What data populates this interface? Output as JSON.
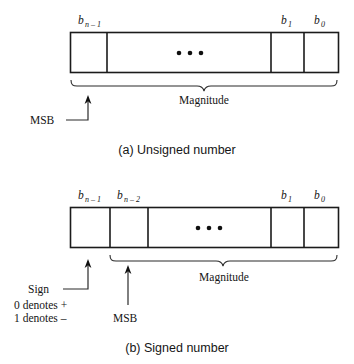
{
  "figure": {
    "background_color": "#ffffff",
    "line_color": "#1b1b1b",
    "panels": [
      {
        "id": "unsigned",
        "caption": "(a) Unsigned number",
        "cells": [
          {
            "label_base": "b",
            "label_sub": "n – 1",
            "show_label": true,
            "has_dots": false
          },
          {
            "label_base": "",
            "label_sub": "",
            "show_label": false,
            "has_dots": true
          },
          {
            "label_base": "b",
            "label_sub": "1",
            "show_label": true,
            "has_dots": false
          },
          {
            "label_base": "b",
            "label_sub": "0",
            "show_label": true,
            "has_dots": false
          }
        ],
        "brace_label": "Magnitude",
        "pointer_label": "MSB"
      },
      {
        "id": "signed",
        "caption": "(b) Signed number",
        "cells": [
          {
            "label_base": "b",
            "label_sub": "n – 1",
            "show_label": true,
            "has_dots": false
          },
          {
            "label_base": "b",
            "label_sub": "n – 2",
            "show_label": true,
            "has_dots": false
          },
          {
            "label_base": "",
            "label_sub": "",
            "show_label": false,
            "has_dots": true
          },
          {
            "label_base": "b",
            "label_sub": "1",
            "show_label": true,
            "has_dots": false
          },
          {
            "label_base": "b",
            "label_sub": "0",
            "show_label": true,
            "has_dots": false
          }
        ],
        "brace_label": "Magnitude",
        "pointer_label": "MSB",
        "sign_label": "Sign",
        "sign_note_positive": "0 denotes +",
        "sign_note_negative": "1 denotes –"
      }
    ]
  }
}
